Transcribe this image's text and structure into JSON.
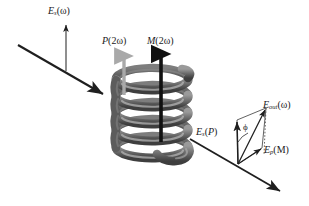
{
  "figure": {
    "background_color": "#ffffff",
    "width": 309,
    "height": 206
  },
  "labels": {
    "incident_field": {
      "symbol": "E",
      "subscript": "s",
      "argument": "(ω)",
      "text": "E_s(ω)"
    },
    "polarization": {
      "symbol": "P",
      "argument": "(2ω)",
      "text": "P(2ω)"
    },
    "magnetization": {
      "symbol": "M",
      "argument": "(2ω)",
      "text": "M(2ω)"
    },
    "output_field": {
      "symbol": "E",
      "subscript": "out",
      "argument": "(ω)",
      "text": "E_out(ω)"
    },
    "s_component": {
      "symbol": "E",
      "subscript": "s",
      "argument": "(P)",
      "text": "E_s(P)"
    },
    "p_component": {
      "symbol": "E",
      "subscript": "p",
      "argument": "(M)",
      "text": "E_p(M)"
    },
    "angle": {
      "symbol": "ϕ",
      "text": "ϕ"
    }
  },
  "colors": {
    "beam": "#1f1f1f",
    "arrow_black": "#111111",
    "arrow_gray": "#a9a9a9",
    "helix_light": "#8c8c8c",
    "helix_mid": "#6e6e6e",
    "helix_dark": "#4a4a4a",
    "thin_line": "#2a2a2a",
    "dotted": "#555555",
    "text": "#1a1a1a"
  },
  "elements": {
    "incident_beam": {
      "name": "incident-beam-arrow",
      "from": [
        18,
        45
      ],
      "to": [
        106,
        96
      ]
    },
    "outgoing_beam": {
      "name": "outgoing-beam-arrow",
      "from": [
        190,
        139
      ],
      "to": [
        283,
        193
      ]
    },
    "vertical_field_arrow": {
      "name": "incident-field-arrow",
      "from": [
        66,
        71
      ],
      "to": [
        66,
        23
      ]
    },
    "p_arrow": {
      "name": "polarization-arrow",
      "from": [
        124,
        92
      ],
      "to": [
        124,
        52
      ],
      "color": "#a9a9a9"
    },
    "m_arrow": {
      "name": "magnetization-arrow",
      "from": [
        161,
        140
      ],
      "to": [
        161,
        50
      ],
      "color": "#111111"
    },
    "helix": {
      "name": "chiral-helix",
      "turns": 5,
      "center_x": 152,
      "top_y": 72,
      "bottom_y": 160,
      "radius_x": 36,
      "radius_y": 11
    },
    "vector_origin": [
      238,
      164
    ],
    "vector_s_tip": [
      237,
      120
    ],
    "vector_p_tip": [
      262,
      148
    ],
    "vector_out_tip": [
      266,
      108
    ]
  }
}
